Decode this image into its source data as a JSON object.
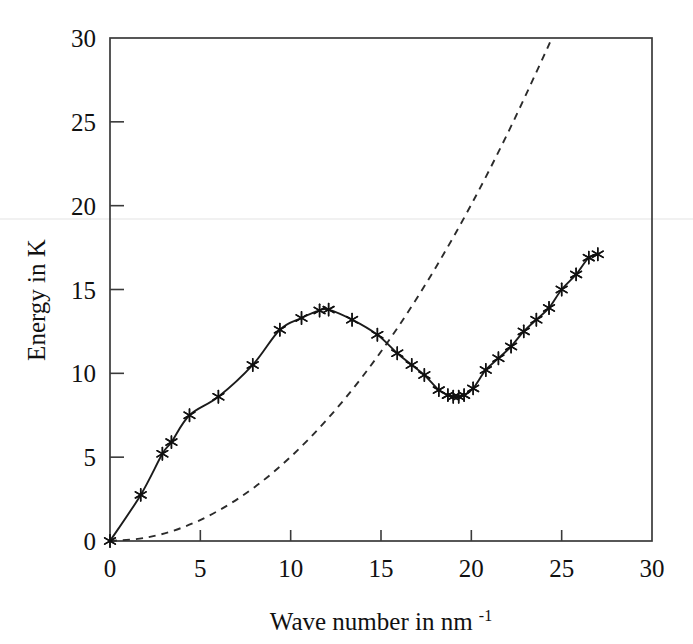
{
  "figure": {
    "background": "#ffffff",
    "ink_color": "#1b1b1b"
  },
  "chart_data": {
    "type": "line",
    "title": "",
    "subtitle": "",
    "xlabel": "Wave number in nm",
    "xlabel_superscript": "-1",
    "xlabel_full": "Wave number in nm-1",
    "ylabel": "Energy in K",
    "xlim": [
      0,
      30
    ],
    "ylim": [
      0,
      30
    ],
    "xticks": [
      0,
      5,
      10,
      15,
      20,
      25,
      30
    ],
    "yticks": [
      0,
      5,
      10,
      15,
      20,
      25,
      30
    ],
    "xticklabels": [
      "0",
      "5",
      "10",
      "15",
      "20",
      "25",
      "30"
    ],
    "yticklabels": [
      "0",
      "5",
      "10",
      "15",
      "20",
      "25",
      "30"
    ],
    "grid": false,
    "legend": "none",
    "frame": "box",
    "tick_direction": "in",
    "series": [
      {
        "name": "Measured dispersion",
        "style": "solid-with-markers",
        "marker": "asterisk",
        "color": "#1b1b1b",
        "x": [
          0.0,
          1.7,
          2.9,
          3.4,
          4.4,
          6.0,
          7.9,
          9.4,
          10.6,
          11.6,
          12.1,
          13.4,
          14.8,
          15.9,
          16.7,
          17.4,
          18.2,
          18.7,
          19.0,
          19.3,
          19.6,
          20.1,
          20.8,
          21.5,
          22.2,
          22.9,
          23.6,
          24.3,
          25.0,
          25.8,
          26.5,
          27.0
        ],
        "y": [
          0.0,
          2.75,
          5.2,
          5.9,
          7.5,
          8.6,
          10.5,
          12.6,
          13.3,
          13.75,
          13.8,
          13.2,
          12.3,
          11.2,
          10.5,
          9.9,
          9.0,
          8.7,
          8.6,
          8.6,
          8.7,
          9.1,
          10.2,
          10.9,
          11.6,
          12.5,
          13.2,
          13.9,
          15.0,
          15.9,
          16.9,
          17.1
        ]
      },
      {
        "name": "Free particle parabola",
        "style": "dashed",
        "marker": "none",
        "color": "#2b2b2b",
        "x": [
          0.0,
          2.0,
          4.0,
          6.0,
          8.0,
          10.0,
          12.0,
          14.0,
          16.0,
          18.0,
          20.0,
          22.0,
          24.0,
          24.45
        ],
        "y": [
          0.0,
          0.2,
          0.8,
          1.81,
          3.21,
          5.02,
          7.23,
          9.84,
          12.85,
          16.26,
          20.07,
          24.29,
          28.9,
          30.0
        ]
      }
    ]
  },
  "annotations": {
    "scan_artifact_line": "horizontal scan line"
  }
}
